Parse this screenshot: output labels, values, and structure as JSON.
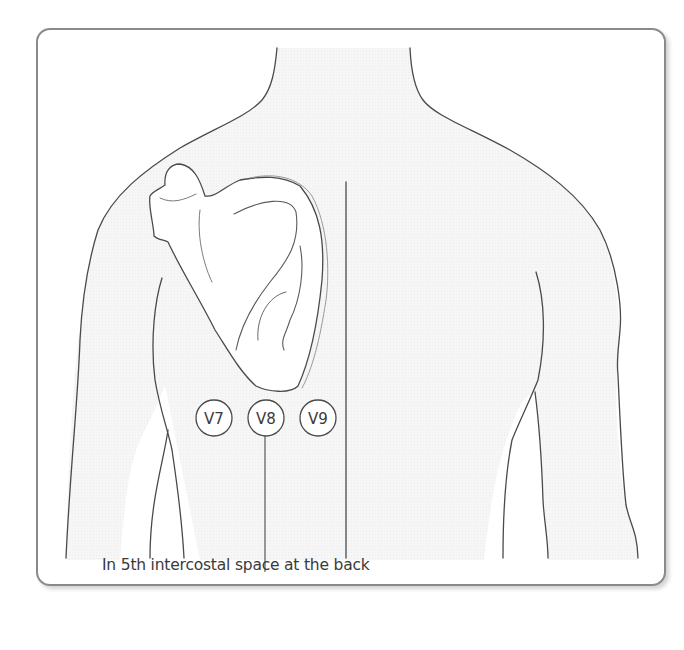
{
  "figure": {
    "leads": [
      {
        "id": "V7",
        "label": "V7",
        "cx": 214,
        "cy": 418
      },
      {
        "id": "V8",
        "label": "V8",
        "cx": 266,
        "cy": 418
      },
      {
        "id": "V9",
        "label": "V9",
        "cx": 318,
        "cy": 418
      }
    ],
    "caption": "In 5th intercostal space at the back",
    "colors": {
      "outline": "#4a4a4a",
      "frame": "#8a8a8a",
      "body_fill": "#f4f4f4",
      "text": "#3a3a3a"
    }
  }
}
